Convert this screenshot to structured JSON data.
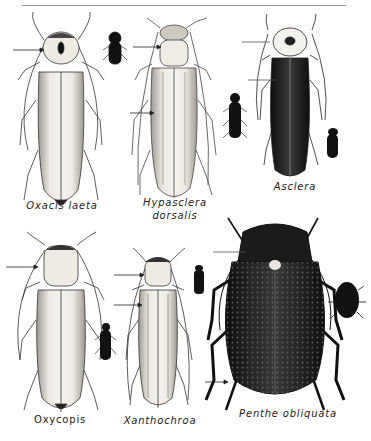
{
  "plate": {
    "title": "False blister beetles plate",
    "colors": {
      "ink": "#1a1a1a",
      "pale": "#e9e6df",
      "shade": "#b8b3aa",
      "rule": "#9a9a9a"
    }
  },
  "species": [
    {
      "name": "Oxacis laeta",
      "label_style": "italic",
      "body": "pale-striped",
      "arrows": 1
    },
    {
      "name": "Hypasclera",
      "name2": "dorsalis",
      "label_style": "italic",
      "body": "pale-striped",
      "arrows": 2
    },
    {
      "name": "Asclera",
      "label_style": "italic",
      "body": "dark",
      "arrows": 2
    },
    {
      "name": "Oxycopis",
      "label_style": "roman",
      "body": "pale",
      "arrows": 1
    },
    {
      "name": "Xanthochroa",
      "label_style": "italic",
      "body": "pale-striped",
      "arrows": 2
    },
    {
      "name": "Penthe obliquata",
      "label_style": "italic",
      "body": "dark-punctate",
      "arrows": 2
    }
  ]
}
